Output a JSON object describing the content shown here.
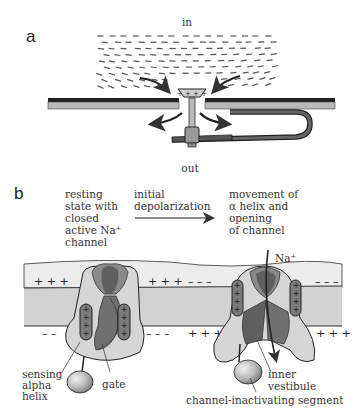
{
  "figure": {
    "panel_a": {
      "letter": "a",
      "label_in": "in",
      "label_out": "out",
      "charges_plate": "+ + + +"
    },
    "panel_b": {
      "letter": "b",
      "caption_left": [
        "resting",
        "state with",
        "closed",
        "active Na⁺",
        "channel"
      ],
      "caption_middle": [
        "initial",
        "depolarization"
      ],
      "caption_right": [
        "movement of",
        "α helix and",
        "opening",
        "of channel"
      ],
      "ion_label": "Na⁺",
      "charges": {
        "top_left": "+ + +",
        "top_mid": "+ + +",
        "top_mid_neg": "– – –",
        "top_right_neg": "– – –",
        "bottom_left_neg": "– –",
        "bottom_mid_neg": "– – –",
        "bottom_mid_pos": "+ + +",
        "bottom_right_pos": "+ + +"
      },
      "labels": {
        "sensing": [
          "sensing",
          "alpha",
          "helix"
        ],
        "gate": "gate",
        "inner_vestibule": [
          "inner",
          "vestibule"
        ],
        "inactivating": "channel-inactivating segment"
      }
    },
    "colors": {
      "membrane_light": "#e6e6e6",
      "membrane_mid": "#cfcfcf",
      "channel_light": "#d4d4d4",
      "channel_mid": "#8c8c8c",
      "channel_dark": "#5e5e5e",
      "helix": "#7a7a7a",
      "outline": "#222222",
      "arrow": "#333333",
      "dash": "#555555"
    }
  }
}
